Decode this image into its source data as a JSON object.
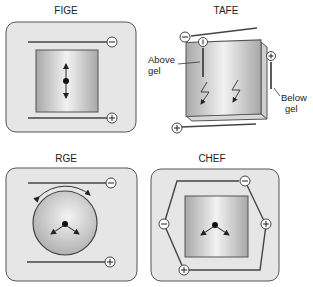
{
  "panels": {
    "fige": {
      "title": "FIGE",
      "top_electrode": "−",
      "bottom_electrode": "+"
    },
    "tafe": {
      "title": "TAFE",
      "top_electrode": "−",
      "bottom_electrode": "+",
      "above_gel_electrode": "−",
      "below_gel_electrode": "+",
      "above_label_line1": "Above",
      "above_label_line2": "gel",
      "below_label_line1": "Below",
      "below_label_line2": "gel"
    },
    "rge": {
      "title": "RGE",
      "top_electrode": "−",
      "bottom_electrode": "+"
    },
    "chef": {
      "title": "CHEF",
      "electrodes": [
        "−",
        "+",
        "−",
        "+"
      ]
    }
  },
  "colors": {
    "panel_fill": "#e6e6e6",
    "panel_stroke": "#555555",
    "gel_light": "#f4f4f4",
    "gel_dark": "#a8a8a8",
    "line": "#444444"
  }
}
